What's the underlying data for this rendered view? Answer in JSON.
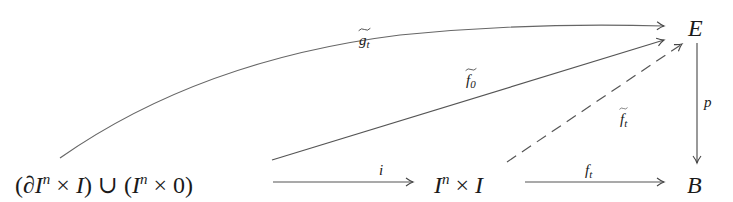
{
  "diagram": {
    "type": "commutative-diagram",
    "nodes": {
      "source": {
        "parts": [
          "(",
          "∂",
          "I",
          "n",
          " × ",
          "I",
          ") ",
          " ∪ ",
          " (",
          "I",
          "n",
          " × 0)"
        ],
        "text": "(∂Iⁿ × I) ∪ (Iⁿ × 0)"
      },
      "cube": {
        "base": "I",
        "exp": "n",
        "times": " × ",
        "second": "I",
        "text": "Iⁿ × I"
      },
      "E": {
        "text": "E"
      },
      "B": {
        "text": "B"
      }
    },
    "arrows": [
      {
        "id": "i",
        "from": "source",
        "to": "cube",
        "label": "i",
        "style": "solid"
      },
      {
        "id": "f_t",
        "from": "cube",
        "to": "B",
        "label_base": "f",
        "label_sub": "t",
        "style": "solid"
      },
      {
        "id": "p",
        "from": "E",
        "to": "B",
        "label": "p",
        "style": "solid"
      },
      {
        "id": "g_tilde_t",
        "from": "source",
        "to": "E",
        "label_base": "g",
        "label_sub": "t",
        "tilde": true,
        "style": "curved"
      },
      {
        "id": "f_tilde_0",
        "from": "source",
        "to": "E",
        "label_base": "f",
        "label_sub": "0",
        "tilde": true,
        "style": "solid"
      },
      {
        "id": "f_tilde_t",
        "from": "cube",
        "to": "E",
        "label_base": "f",
        "label_sub": "t",
        "tilde": true,
        "style": "dashed"
      }
    ],
    "colors": {
      "ink": "#1a1a1a",
      "line": "#555555"
    }
  }
}
